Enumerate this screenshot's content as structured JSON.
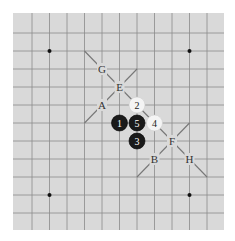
{
  "diagram": {
    "type": "go-board-section",
    "colors": {
      "board": "#d9d9d9",
      "grid": "#8a8a8a",
      "star": "#111111",
      "black_stone": "#1a1a1a",
      "white_stone": "#f4f4f4",
      "diagonal": "#777777"
    },
    "grid": {
      "x": [
        32,
        49.5,
        67,
        84.5,
        102,
        119.5,
        137,
        154.5,
        172,
        189.5,
        207
      ],
      "y": [
        33,
        51,
        69,
        87,
        105,
        123,
        141,
        159,
        177,
        195,
        213
      ]
    },
    "star_points": [
      [
        1,
        1
      ],
      [
        9,
        1
      ],
      [
        1,
        9
      ],
      [
        9,
        9
      ]
    ],
    "stones": [
      {
        "color": "black",
        "label": "1",
        "col": 5,
        "row": 5
      },
      {
        "color": "black",
        "label": "5",
        "col": 6,
        "row": 5
      },
      {
        "color": "black",
        "label": "3",
        "col": 6,
        "row": 6
      },
      {
        "color": "white",
        "label": "2",
        "col": 6,
        "row": 4
      },
      {
        "color": "white",
        "label": "4",
        "col": 7,
        "row": 5
      }
    ],
    "point_labels": [
      {
        "label": "G",
        "col": 4,
        "row": 2
      },
      {
        "label": "E",
        "col": 5,
        "row": 3
      },
      {
        "label": "A",
        "col": 4,
        "row": 4
      },
      {
        "label": "F",
        "col": 8,
        "row": 6
      },
      {
        "label": "B",
        "col": 7,
        "row": 7
      },
      {
        "label": "H",
        "col": 9,
        "row": 7
      }
    ],
    "diagonals": [
      {
        "from": [
          3,
          1
        ],
        "to": [
          10,
          8
        ]
      },
      {
        "from": [
          6,
          2
        ],
        "to": [
          3,
          5
        ]
      },
      {
        "from": [
          9,
          5
        ],
        "to": [
          6,
          8
        ]
      }
    ]
  }
}
